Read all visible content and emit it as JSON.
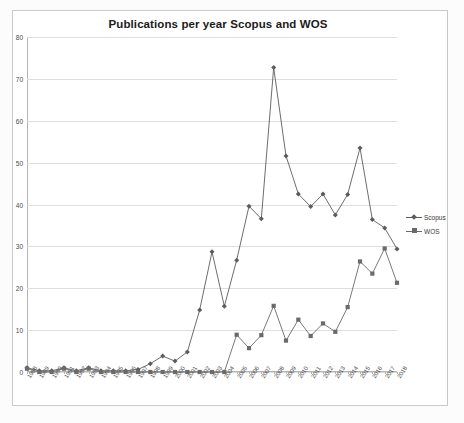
{
  "figure": {
    "title": "Publications per year Scopus and WOS",
    "background_color": "#ffffff",
    "frame_color": "#c9c9c9"
  },
  "legend": {
    "position": "right",
    "entries": [
      {
        "label": "Scopus",
        "marker": "diamond",
        "color": "#5c5c5c"
      },
      {
        "label": "WOS",
        "marker": "square",
        "color": "#6a6a6a"
      }
    ]
  },
  "axes": {
    "y_ticks": [
      0,
      10,
      20,
      30,
      40,
      50,
      60,
      70,
      80
    ],
    "x_tick_rotation": "-56deg"
  },
  "chart_data": {
    "type": "line",
    "title": "Publications per year Scopus and WOS",
    "xlabel": "",
    "ylabel": "",
    "ylim": [
      0,
      80
    ],
    "grid": true,
    "legend_position": "right",
    "categories": [
      "1988",
      "1989",
      "1990",
      "1991",
      "1992",
      "1993",
      "1994",
      "1995",
      "1996",
      "1997",
      "1998",
      "1999",
      "2000",
      "2001",
      "2002",
      "2003",
      "2004",
      "2005",
      "2006",
      "2007",
      "2008",
      "2009",
      "2010",
      "2011",
      "2012",
      "2013",
      "2014",
      "2015",
      "2016",
      "2017",
      "2018"
    ],
    "series": [
      {
        "name": "Scopus",
        "marker": "diamond",
        "color": "#5c5c5c",
        "values": [
          1,
          0.3,
          0.3,
          1,
          0.3,
          1,
          0.3,
          0.3,
          0.3,
          0.6,
          2,
          3.8,
          2.6,
          4.8,
          14.8,
          28.7,
          15.7,
          26.7,
          39.6,
          36.6,
          72.7,
          51.6,
          42.5,
          39.5,
          42.5,
          37.5,
          42.4,
          53.5,
          36.4,
          34.4,
          29.4
        ]
      },
      {
        "name": "WOS",
        "marker": "square",
        "color": "#6a6a6a",
        "values": [
          0.8,
          0,
          0,
          0.8,
          0,
          0.8,
          0,
          0,
          0,
          0,
          0,
          0,
          0,
          0,
          0,
          0,
          0,
          8.9,
          5.7,
          8.8,
          15.8,
          7.5,
          12.5,
          8.6,
          11.6,
          9.6,
          15.5,
          26.4,
          23.5,
          29.5,
          21.3
        ]
      }
    ]
  }
}
